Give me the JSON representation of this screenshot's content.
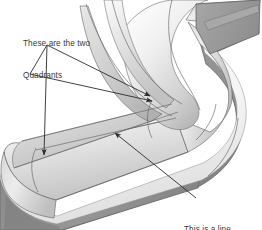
{
  "image": {
    "type": "cad-shaded-render",
    "subject": "s-curved-swept-channel-solid",
    "width": 262,
    "height": 230,
    "background_color": "#ffffff",
    "projection": "isometric-perspective"
  },
  "annotations": [
    {
      "id": "quadrants",
      "text": "These are the two\nQuadrants",
      "line1": "These are the two",
      "line2": "Quadrants",
      "text_color": "#3a3a3a",
      "text_x": 23,
      "text_y": 18,
      "leader_color": "#2b2b2b",
      "leader_vertex": {
        "x": 47,
        "y": 45
      },
      "arrow_targets": [
        {
          "x": 44,
          "y": 160
        },
        {
          "x": 154,
          "y": 99
        }
      ],
      "arrow_count": 2
    },
    {
      "id": "line",
      "text": "This is a line",
      "line1": "This is a line",
      "text_color": "#3a3a3a",
      "text_x": 184,
      "text_y": 204,
      "leader_color": "#2b2b2b",
      "leader_start": {
        "x": 196,
        "y": 198
      },
      "arrow_targets": [
        {
          "x": 112,
          "y": 131
        }
      ],
      "arrow_count": 1
    }
  ],
  "geometry": {
    "surfaces": [
      {
        "name": "top-face-light",
        "fill": "#d8d8d8"
      },
      {
        "name": "inner-fillet-highlight",
        "fill": "#f3f3f3"
      },
      {
        "name": "outer-side-face-dark",
        "fill": "#8b8b8b"
      },
      {
        "name": "end-cap-face",
        "fill": "#9a9a9a"
      },
      {
        "name": "white-rim-band",
        "fill": "#f7f7f7"
      }
    ],
    "edge_color": "#555555",
    "isoline_color": "#6a6a6a",
    "quadrant_curves": 2,
    "tangent_edge_lines": 4
  },
  "colors": {
    "background": "#ffffff",
    "light_gray": "#d8d8d8",
    "mid_gray": "#b4b4b4",
    "dark_gray": "#8b8b8b",
    "darker_gray": "#787878",
    "highlight": "#f7f7f7",
    "edge": "#555555",
    "annotation": "#2b2b2b",
    "text": "#3a3a3a"
  }
}
